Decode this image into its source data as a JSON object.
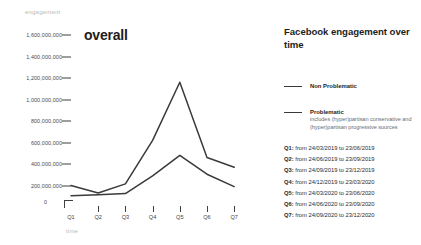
{
  "chart_data": {
    "type": "line",
    "title": "overall",
    "xlabel": "time",
    "ylabel": "engagement",
    "categories": [
      "Q1",
      "Q2",
      "Q3",
      "Q4",
      "Q5",
      "Q6",
      "Q7"
    ],
    "ylim": [
      0,
      1600000000
    ],
    "yticks": [
      "0",
      "200,000,000",
      "400,000,000",
      "600,000,000",
      "800,000,000",
      "1,000,000,000",
      "1,200,000,000",
      "1,400,000,000",
      "1,600,000,000"
    ],
    "ytick_values": [
      0,
      200000000,
      400000000,
      600000000,
      800000000,
      1000000000,
      1200000000,
      1400000000,
      1600000000
    ],
    "grid": false,
    "legend_position": "right",
    "series": [
      {
        "name": "Non Problematic",
        "color": "#3a3a3a",
        "values": [
          200000000,
          130000000,
          215000000,
          620000000,
          1160000000,
          460000000,
          370000000
        ]
      },
      {
        "name": "Problematic",
        "color": "#3a3a3a",
        "values": [
          105000000,
          115000000,
          125000000,
          290000000,
          480000000,
          305000000,
          190000000
        ]
      }
    ]
  },
  "info": {
    "title": "Facebook engagement over time",
    "legend": [
      {
        "label": "Non Problematic",
        "description": ""
      },
      {
        "label": "Problematic",
        "description": "includes (hyper)partisan conservative and (hyper)partisan progressive sources"
      }
    ],
    "quarters": [
      "Q1: from 24/03/2019 to 23/06/2019",
      "Q2: from 24/06/2019 to 23/09/2019",
      "Q3: from 24/09/2019 to 23/12/2019",
      "Q4: from 24/12/2019 to 23/03/2020",
      "Q5: from 24/03/2020 to 23/06/2020",
      "Q6: from 24/06/2020 to 23/09/2020",
      "Q7: from 24/09/2020 to 23/12/2020"
    ]
  }
}
